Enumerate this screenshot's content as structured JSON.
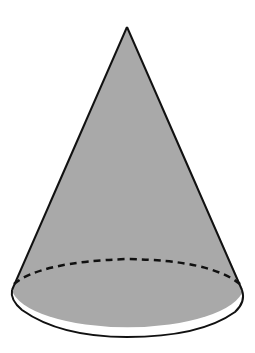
{
  "figure": {
    "shape": "cone",
    "title": "Cone",
    "colors": {
      "fill": "#a9a9a9",
      "stroke": "#111111",
      "background": "#ffffff"
    },
    "apex": {
      "x": 127,
      "y": 27
    },
    "base": {
      "cx": 127,
      "cy": 296,
      "rx": 116,
      "ry": 41
    },
    "hidden_edge_style": "dashed"
  }
}
